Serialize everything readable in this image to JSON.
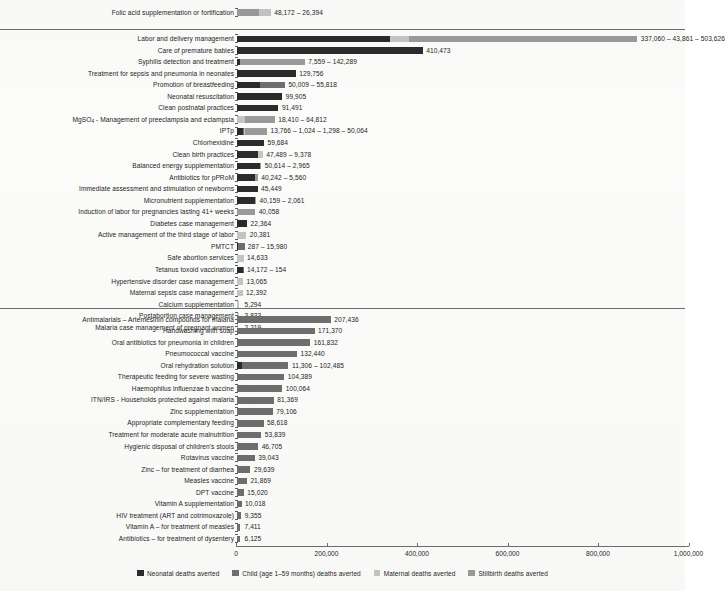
{
  "chart_data": {
    "type": "bar",
    "orientation": "horizontal",
    "stacked": true,
    "title": "",
    "xlabel": "",
    "ylabel": "",
    "xlim": [
      0,
      1000000
    ],
    "grid": false,
    "legend_position": "bottom",
    "axis_ticks": [
      {
        "value": 0,
        "label": "0"
      },
      {
        "value": 200000,
        "label": "200,000"
      },
      {
        "value": 400000,
        "label": "400,000"
      },
      {
        "value": 600000,
        "label": "600,000"
      },
      {
        "value": 800000,
        "label": "800,000"
      },
      {
        "value": 1000000,
        "label": "1,000,000"
      }
    ],
    "series": [
      {
        "name": "Neonatal deaths averted",
        "color": "#2b2b2b"
      },
      {
        "name": "Child (age 1–59 months) deaths averted",
        "color": "#6e6e6e"
      },
      {
        "name": "Maternal deaths averted",
        "color": "#c4c4c4"
      },
      {
        "name": "Stillbirth deaths averted",
        "color": "#9a9a9a"
      }
    ],
    "groups": [
      {
        "id": "group-1",
        "rows": [
          {
            "label": "Folic acid supplementation or fortification",
            "value_text": "48,172 – 26,394",
            "segments": [
              {
                "series": 0,
                "value": 0
              },
              {
                "series": 1,
                "value": 0
              },
              {
                "series": 2,
                "value": 0
              },
              {
                "series": 3,
                "value": 48172
              },
              {
                "series": 2,
                "value": 26394
              }
            ]
          }
        ]
      },
      {
        "id": "group-2",
        "rows": [
          {
            "label": "Labor and delivery management",
            "value_text": "337,060 – 43,861 – 503,626",
            "segments": [
              {
                "series": 0,
                "value": 337060
              },
              {
                "series": 2,
                "value": 43861
              },
              {
                "series": 3,
                "value": 503626
              }
            ]
          },
          {
            "label": "Care of premature babies",
            "value_text": "410,473",
            "segments": [
              {
                "series": 0,
                "value": 410473
              }
            ]
          },
          {
            "label": "Syphilis detection and treatment",
            "value_text": "7,559 – 142,289",
            "segments": [
              {
                "series": 0,
                "value": 7559
              },
              {
                "series": 3,
                "value": 142289
              }
            ]
          },
          {
            "label": "Treatment for sepsis and pneumonia in neonates",
            "value_text": "129,756",
            "segments": [
              {
                "series": 0,
                "value": 129756
              }
            ]
          },
          {
            "label": "Promotion of breastfeeding",
            "value_text": "50,009 – 55,818",
            "segments": [
              {
                "series": 0,
                "value": 50009
              },
              {
                "series": 1,
                "value": 55818
              }
            ]
          },
          {
            "label": "Neonatal resuscitation",
            "value_text": "99,905",
            "segments": [
              {
                "series": 0,
                "value": 99905
              }
            ]
          },
          {
            "label": "Clean postnatal practices",
            "value_text": "91,491",
            "segments": [
              {
                "series": 0,
                "value": 91491
              }
            ]
          },
          {
            "label": "MgSO₄ - Management of preeclampsia and eclampsia",
            "label_html": "MgSO<sub>4</sub> - Management of preeclampsia and eclampsia",
            "value_text": "18,410 – 64,812",
            "segments": [
              {
                "series": 2,
                "value": 18410
              },
              {
                "series": 3,
                "value": 64812
              }
            ]
          },
          {
            "label": "IPTp",
            "value_text": "13,766 – 1,024 – 1,298 – 50,064",
            "segments": [
              {
                "series": 0,
                "value": 13766
              },
              {
                "series": 1,
                "value": 1024
              },
              {
                "series": 2,
                "value": 1298
              },
              {
                "series": 3,
                "value": 50064
              }
            ]
          },
          {
            "label": "Chlorhexidine",
            "value_text": "59,684",
            "segments": [
              {
                "series": 0,
                "value": 59684
              }
            ]
          },
          {
            "label": "Clean birth practices",
            "value_text": "47,489 – 9,378",
            "segments": [
              {
                "series": 0,
                "value": 47489
              },
              {
                "series": 2,
                "value": 9378
              }
            ]
          },
          {
            "label": "Balanced energy supplementation",
            "value_text": "50,614 – 2,965",
            "segments": [
              {
                "series": 0,
                "value": 50614
              },
              {
                "series": 3,
                "value": 2965
              }
            ]
          },
          {
            "label": "Antibiotics for pPRoM",
            "value_text": "40,242 – 5,560",
            "segments": [
              {
                "series": 0,
                "value": 40242
              },
              {
                "series": 3,
                "value": 5560
              }
            ]
          },
          {
            "label": "Immediate assessment and stimulation of newborns",
            "value_text": "45,449",
            "segments": [
              {
                "series": 0,
                "value": 45449
              }
            ]
          },
          {
            "label": "Micronutrient supplementation",
            "value_text": "40,159 – 2,061",
            "segments": [
              {
                "series": 0,
                "value": 40159
              },
              {
                "series": 3,
                "value": 2061
              }
            ]
          },
          {
            "label": "Induction of labor for pregnancies lasting 41+ weeks",
            "value_text": "40,058",
            "segments": [
              {
                "series": 3,
                "value": 40058
              }
            ]
          },
          {
            "label": "Diabetes case management",
            "value_text": "22,364",
            "segments": [
              {
                "series": 0,
                "value": 22364
              }
            ]
          },
          {
            "label": "Active management of the third stage of labor",
            "value_text": "20,381",
            "segments": [
              {
                "series": 2,
                "value": 20381
              }
            ]
          },
          {
            "label": "PMTCT",
            "value_text": "287 – 15,980",
            "segments": [
              {
                "series": 0,
                "value": 287
              },
              {
                "series": 1,
                "value": 15980
              }
            ]
          },
          {
            "label": "Safe abortion services",
            "value_text": "14,633",
            "segments": [
              {
                "series": 2,
                "value": 14633
              }
            ]
          },
          {
            "label": "Tetanus toxoid vaccination",
            "value_text": "14,172 – 154",
            "segments": [
              {
                "series": 0,
                "value": 14172
              },
              {
                "series": 1,
                "value": 154
              }
            ]
          },
          {
            "label": "Hypertensive disorder case management",
            "value_text": "13,065",
            "segments": [
              {
                "series": 2,
                "value": 13065
              }
            ]
          },
          {
            "label": "Maternal sepsis case management",
            "value_text": "12,392",
            "segments": [
              {
                "series": 2,
                "value": 12392
              }
            ]
          },
          {
            "label": "Calcium supplementation",
            "value_text": "5,294",
            "segments": [
              {
                "series": 2,
                "value": 5294
              }
            ]
          },
          {
            "label": "Postabortion case management",
            "value_text": "3,833",
            "segments": [
              {
                "series": 2,
                "value": 3833
              }
            ]
          },
          {
            "label": "Malaria case management of pregnant women",
            "value_text": "2,219",
            "segments": [
              {
                "series": 2,
                "value": 2219
              }
            ]
          }
        ]
      },
      {
        "id": "group-3",
        "rows": [
          {
            "label": "Antimalarials – Artemesinin compounds for malaria",
            "value_text": "207,436",
            "segments": [
              {
                "series": 1,
                "value": 207436
              }
            ]
          },
          {
            "label": "Handwashing with soap",
            "value_text": "171,370",
            "segments": [
              {
                "series": 1,
                "value": 171370
              }
            ]
          },
          {
            "label": "Oral antibiotics for pneumonia in children",
            "value_text": "161,832",
            "segments": [
              {
                "series": 1,
                "value": 161832
              }
            ]
          },
          {
            "label": "Pneumococcal vaccine",
            "value_text": "132,440",
            "segments": [
              {
                "series": 1,
                "value": 132440
              }
            ]
          },
          {
            "label": "Oral rehydration solution",
            "value_text": "11,306 – 102,485",
            "segments": [
              {
                "series": 0,
                "value": 11306
              },
              {
                "series": 1,
                "value": 102485
              }
            ]
          },
          {
            "label": "Therapeutic feeding for severe wasting",
            "value_text": "104,389",
            "segments": [
              {
                "series": 1,
                "value": 104389
              }
            ]
          },
          {
            "label": "Haemophilus influenzae b vaccine",
            "value_text": "100,064",
            "segments": [
              {
                "series": 1,
                "value": 100064
              }
            ]
          },
          {
            "label": "ITN/IRS - Households protected against malaria",
            "value_text": "81,369",
            "segments": [
              {
                "series": 1,
                "value": 81369
              }
            ]
          },
          {
            "label": "Zinc supplementation",
            "value_text": "79,106",
            "segments": [
              {
                "series": 1,
                "value": 79106
              }
            ]
          },
          {
            "label": "Appropriate complementary feeding",
            "value_text": "58,618",
            "segments": [
              {
                "series": 1,
                "value": 58618
              }
            ]
          },
          {
            "label": "Treatment for moderate acute malnutrition",
            "value_text": "53,839",
            "segments": [
              {
                "series": 1,
                "value": 53839
              }
            ]
          },
          {
            "label": "Hygienic disposal of children's stools",
            "value_text": "46,705",
            "segments": [
              {
                "series": 1,
                "value": 46705
              }
            ]
          },
          {
            "label": "Rotavirus vaccine",
            "value_text": "39,043",
            "segments": [
              {
                "series": 1,
                "value": 39043
              }
            ]
          },
          {
            "label": "Zinc – for treatment of diarrhea",
            "value_text": "29,639",
            "segments": [
              {
                "series": 1,
                "value": 29639
              }
            ]
          },
          {
            "label": "Measles vaccine",
            "value_text": "21,869",
            "segments": [
              {
                "series": 1,
                "value": 21869
              }
            ]
          },
          {
            "label": "DPT vaccine",
            "value_text": "15,020",
            "segments": [
              {
                "series": 1,
                "value": 15020
              }
            ]
          },
          {
            "label": "Vitamin A supplementation",
            "value_text": "10,018",
            "segments": [
              {
                "series": 1,
                "value": 10018
              }
            ]
          },
          {
            "label": "HIV treatment (ART and cotrimoxazole)",
            "value_text": "9,355",
            "segments": [
              {
                "series": 1,
                "value": 9355
              }
            ]
          },
          {
            "label": "Vitamin A – for treatment of measles",
            "value_text": "7,411",
            "segments": [
              {
                "series": 1,
                "value": 7411
              }
            ]
          },
          {
            "label": "Antibiotics – for treatment of dysentery",
            "value_text": "6,125",
            "segments": [
              {
                "series": 1,
                "value": 6125
              }
            ]
          }
        ]
      }
    ]
  }
}
